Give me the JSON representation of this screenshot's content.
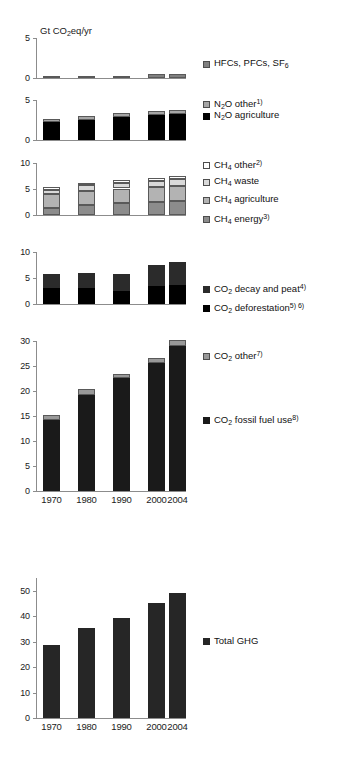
{
  "axis_title": "Gt CO2eq/yr",
  "axis_title_parts": {
    "pre": "Gt CO",
    "sub": "2",
    "post": "eq/yr"
  },
  "categories": [
    "1970",
    "1980",
    "1990",
    "2000",
    "2004"
  ],
  "chart_data": {
    "type": "bar",
    "title": "Gt CO2eq/yr",
    "xlabel": "",
    "ylabel": "Gt CO2eq/yr",
    "grid": false,
    "legend_position": "right",
    "categories": [
      "1970",
      "1980",
      "1990",
      "2000",
      "2004"
    ],
    "panels": [
      {
        "id": "hfc",
        "ylim": [
          0,
          5
        ],
        "yticks": [
          0,
          5
        ],
        "stacked": true,
        "series": [
          {
            "name": "HFCs, PFCs, SF6",
            "color": "#808080",
            "values": [
              0.08,
              0.14,
              0.22,
              0.44,
              0.5
            ]
          }
        ]
      },
      {
        "id": "n2o",
        "ylim": [
          0,
          5
        ],
        "yticks": [
          0,
          5
        ],
        "stacked": true,
        "series": [
          {
            "name": "N2O agriculture",
            "color": "#000000",
            "values": [
              2.2,
              2.55,
              2.85,
              3.1,
              3.2
            ]
          },
          {
            "name": "N2O other",
            "color": "#a6a6a6",
            "values": [
              0.4,
              0.45,
              0.5,
              0.55,
              0.55
            ]
          }
        ]
      },
      {
        "id": "ch4",
        "ylim": [
          0,
          10
        ],
        "yticks": [
          0,
          5,
          10
        ],
        "stacked": true,
        "series": [
          {
            "name": "CH4 energy",
            "color": "#8c8c8c",
            "values": [
              1.4,
              1.95,
              2.25,
              2.5,
              2.65
            ]
          },
          {
            "name": "CH4 agriculture",
            "color": "#b3b3b3",
            "values": [
              2.55,
              2.65,
              2.85,
              2.85,
              2.95
            ]
          },
          {
            "name": "CH4 waste",
            "color": "#d9d9d9",
            "values": [
              0.9,
              1.1,
              1.15,
              1.25,
              1.3
            ]
          },
          {
            "name": "CH4 other",
            "color": "#ffffff",
            "values": [
              0.6,
              0.55,
              0.45,
              0.55,
              0.55
            ]
          }
        ]
      },
      {
        "id": "co2_land",
        "ylim": [
          0,
          10
        ],
        "yticks": [
          0,
          5,
          10
        ],
        "stacked": true,
        "series": [
          {
            "name": "CO2 deforestation",
            "color": "#000000",
            "values": [
              3.05,
              3.1,
              2.55,
              3.4,
              3.65
            ]
          },
          {
            "name": "CO2 decay and peat",
            "color": "#2b2b2b",
            "values": [
              2.8,
              2.9,
              3.15,
              4.15,
              4.5
            ]
          }
        ]
      },
      {
        "id": "co2_fossil",
        "ylim": [
          0,
          30
        ],
        "yticks": [
          0,
          5,
          10,
          15,
          20,
          25,
          30
        ],
        "stacked": true,
        "series": [
          {
            "name": "CO2 fossil fuel use",
            "color": "#1a1a1a",
            "values": [
              14.2,
              19.3,
              22.7,
              25.6,
              29.1
            ]
          },
          {
            "name": "CO2 other",
            "color": "#999999",
            "values": [
              1.0,
              1.1,
              0.8,
              1.0,
              1.1
            ]
          }
        ]
      },
      {
        "id": "total",
        "ylim": [
          0,
          55
        ],
        "yticks": [
          0,
          10,
          20,
          30,
          40,
          50
        ],
        "stacked": false,
        "series": [
          {
            "name": "Total GHG",
            "color": "#262626",
            "values": [
              28.7,
              35.4,
              39.4,
              45.0,
              49.0
            ]
          }
        ]
      }
    ]
  },
  "legends": {
    "hfc": [
      {
        "label": "HFCs, PFCs, SF6",
        "parts": {
          "pre": "HFCs, PFCs, SF",
          "sub": "6",
          "post": ""
        },
        "color": "#808080",
        "border": "#4d4d4d"
      }
    ],
    "n2o": [
      {
        "label": "N2O other1)",
        "parts": {
          "pre": "N",
          "sub": "2",
          "post": "O other",
          "sup": "1)"
        },
        "color": "#a6a6a6",
        "border": "#4d4d4d"
      },
      {
        "label": "N2O agriculture",
        "parts": {
          "pre": "N",
          "sub": "2",
          "post": "O agriculture",
          "sup": ""
        },
        "color": "#000000",
        "border": "#000000"
      }
    ],
    "ch4": [
      {
        "label": "CH4 other2)",
        "parts": {
          "pre": "CH",
          "sub": "4",
          "post": " other",
          "sup": "2)"
        },
        "color": "#ffffff",
        "border": "#4d4d4d"
      },
      {
        "label": "CH4 waste",
        "parts": {
          "pre": "CH",
          "sub": "4",
          "post": " waste",
          "sup": ""
        },
        "color": "#d9d9d9",
        "border": "#4d4d4d"
      },
      {
        "label": "CH4 agriculture",
        "parts": {
          "pre": "CH",
          "sub": "4",
          "post": " agriculture",
          "sup": ""
        },
        "color": "#b3b3b3",
        "border": "#4d4d4d"
      },
      {
        "label": "CH4 energy3)",
        "parts": {
          "pre": "CH",
          "sub": "4",
          "post": " energy",
          "sup": "3)"
        },
        "color": "#8c8c8c",
        "border": "#4d4d4d"
      }
    ],
    "co2_land": [
      {
        "label": "CO2 decay and peat4)",
        "parts": {
          "pre": "CO",
          "sub": "2",
          "post": " decay and peat",
          "sup": "4)"
        },
        "color": "#2b2b2b",
        "border": "#2b2b2b"
      },
      {
        "label": "CO2 deforestation5) 6)",
        "parts": {
          "pre": "CO",
          "sub": "2",
          "post": " deforestation",
          "sup": "5) 6)"
        },
        "color": "#000000",
        "border": "#000000"
      }
    ],
    "co2_fossil": [
      {
        "label": "CO2 other7)",
        "parts": {
          "pre": "CO",
          "sub": "2",
          "post": " other",
          "sup": "7)"
        },
        "color": "#999999",
        "border": "#4d4d4d"
      },
      {
        "label": "CO2 fossil fuel use8)",
        "parts": {
          "pre": "CO",
          "sub": "2",
          "post": " fossil fuel use",
          "sup": "8)"
        },
        "color": "#1a1a1a",
        "border": "#1a1a1a"
      }
    ],
    "total": [
      {
        "label": "Total GHG",
        "parts": {
          "pre": "Total GHG",
          "sub": "",
          "post": "",
          "sup": ""
        },
        "color": "#262626",
        "border": "#262626"
      }
    ]
  }
}
